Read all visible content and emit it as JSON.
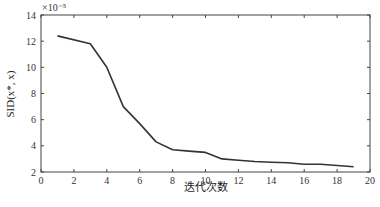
{
  "chart_data": {
    "type": "line",
    "title": "",
    "xlabel": "迭代次数",
    "ylabel": "SID(x*, x)",
    "y_multiplier": "×10⁻⁵",
    "xlim": [
      0,
      20
    ],
    "ylim": [
      2,
      14
    ],
    "xticks": [
      0,
      2,
      4,
      6,
      8,
      10,
      12,
      14,
      16,
      18,
      20
    ],
    "yticks": [
      2,
      4,
      6,
      8,
      10,
      12,
      14
    ],
    "grid": false,
    "legend": null,
    "series": [
      {
        "name": "SID",
        "color": "#333333",
        "x": [
          1,
          3,
          4,
          5,
          6,
          7,
          8,
          9,
          10,
          11,
          12,
          13,
          14,
          15,
          16,
          17,
          18,
          19
        ],
        "values": [
          12.4,
          11.8,
          10.0,
          7.0,
          5.7,
          4.3,
          3.7,
          3.6,
          3.5,
          3.0,
          2.9,
          2.8,
          2.75,
          2.7,
          2.6,
          2.6,
          2.5,
          2.4
        ]
      }
    ]
  }
}
